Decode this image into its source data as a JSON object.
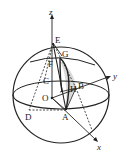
{
  "diagram": {
    "type": "geometry-sphere-3d",
    "axes": {
      "x": "x",
      "y": "y",
      "z": "z"
    },
    "points": {
      "E": "E",
      "G": "G",
      "F": "F",
      "C": "C",
      "H": "H",
      "B": "B",
      "O": "O",
      "D": "D",
      "A": "A"
    },
    "colors": {
      "stroke": "#222222",
      "shade": "#d9d9d9",
      "background": "#ffffff"
    }
  }
}
